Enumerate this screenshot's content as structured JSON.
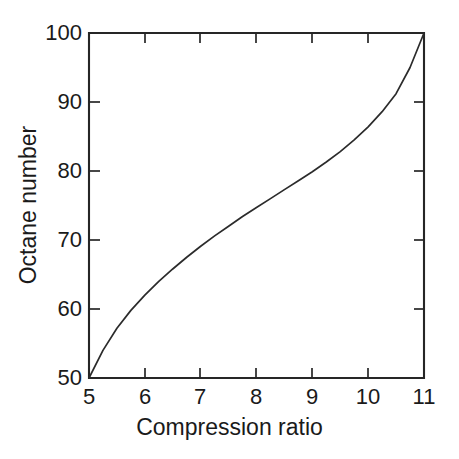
{
  "chart_data": {
    "type": "line",
    "title": "",
    "subtitle": "",
    "xlabel": "Compression ratio",
    "ylabel": "Octane number",
    "xlim": [
      5,
      11
    ],
    "ylim": [
      50,
      100
    ],
    "xticks": [
      5,
      6,
      7,
      8,
      9,
      10,
      11
    ],
    "xtick_labels": [
      "5",
      "6",
      "7",
      "8",
      "9",
      "10",
      "11"
    ],
    "yticks": [
      50,
      60,
      70,
      80,
      90,
      100
    ],
    "ytick_labels": [
      "50",
      "60",
      "70",
      "80",
      "90",
      "100"
    ],
    "grid": false,
    "legend": null,
    "legend_position": "none",
    "annotations": [],
    "series": [
      {
        "name": "Octane requirement",
        "color": "#2b2b2b",
        "line_width": 1.7,
        "x": [
          5.0,
          5.25,
          5.5,
          5.75,
          6.0,
          6.25,
          6.5,
          6.75,
          7.0,
          7.25,
          7.5,
          7.75,
          8.0,
          8.25,
          8.5,
          8.75,
          9.0,
          9.25,
          9.5,
          9.75,
          10.0,
          10.25,
          10.5,
          10.75,
          11.0
        ],
        "y": [
          50.0,
          54.0,
          57.2,
          59.8,
          62.0,
          64.0,
          65.8,
          67.5,
          69.1,
          70.6,
          72.0,
          73.4,
          74.7,
          76.0,
          77.3,
          78.6,
          79.9,
          81.3,
          82.8,
          84.5,
          86.4,
          88.6,
          91.2,
          95.0,
          100.0
        ]
      }
    ]
  },
  "axes": {
    "x_axis_label": "Compression ratio",
    "y_axis_label": "Octane number",
    "x_tick_values": [
      "5",
      "6",
      "7",
      "8",
      "9",
      "10",
      "11"
    ],
    "y_tick_values": [
      "100",
      "90",
      "80",
      "70",
      "60",
      "50"
    ],
    "frame_color": "#262626",
    "background_color": "#ffffff",
    "curve_color": "#2b2b2b"
  }
}
